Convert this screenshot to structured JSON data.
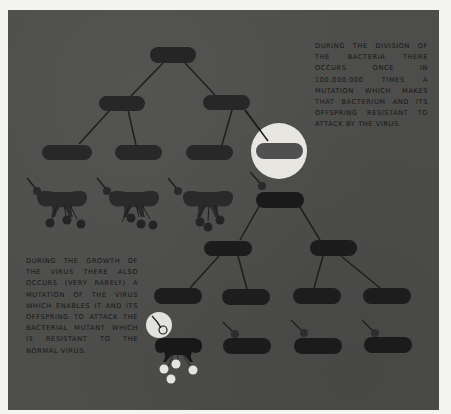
{
  "figure": {
    "background_color": "#4d4d4b",
    "page_color": "#f4f4f2",
    "bacterium_color": "#232323",
    "highlight_color": "#e8e6e0",
    "line_color": "#1e1e1e"
  },
  "captions": {
    "bacterial_mutation": "During the division of the bacteria there occurs once in 100,000,000 times a mutation which makes that bacterium and its offspring resistant to attack by the virus.",
    "virus_mutation": "During the growth of the virus there also occurs (very rarely) a mutation of the virus which enables it and its offspring to attack the bacterial mutant which is resistant to the normal virus."
  },
  "diagram": {
    "upper_tree": {
      "description": "Normal bacteria dividing; three daughters lysed by virus, one resistant mutant highlighted",
      "generations": 3,
      "lysed_by_virus": 3,
      "resistant_mutants": 1
    },
    "lower_tree": {
      "description": "Resistant mutant bacterium dividing; one descendant lysed by mutated virus, others resisting normal virus",
      "generations": 3,
      "lysed_by_mutant_virus": 1,
      "resisting_normal_virus": 3
    }
  }
}
